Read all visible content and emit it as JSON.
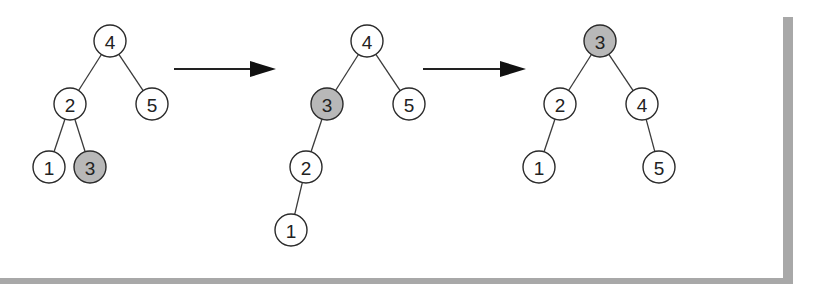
{
  "diagram": {
    "colors": {
      "node_fill": "#ffffff",
      "highlight_fill": "#b8b8b8",
      "stroke": "#2a2a2a",
      "frame": "#a8a8a8"
    },
    "node_radius": 16,
    "trees": [
      {
        "id": "tree-1",
        "nodes": [
          {
            "label": "4",
            "x": 110,
            "y": 41,
            "highlight": false
          },
          {
            "label": "2",
            "x": 70,
            "y": 104,
            "highlight": false
          },
          {
            "label": "5",
            "x": 152,
            "y": 104,
            "highlight": false
          },
          {
            "label": "1",
            "x": 49,
            "y": 167,
            "highlight": false
          },
          {
            "label": "3",
            "x": 90,
            "y": 167,
            "highlight": true
          }
        ],
        "edges": [
          [
            "4",
            "2"
          ],
          [
            "4",
            "5"
          ],
          [
            "2",
            "1"
          ],
          [
            "2",
            "3"
          ]
        ]
      },
      {
        "id": "tree-2",
        "nodes": [
          {
            "label": "4",
            "x": 367,
            "y": 41,
            "highlight": false
          },
          {
            "label": "3",
            "x": 327,
            "y": 104,
            "highlight": true
          },
          {
            "label": "5",
            "x": 409,
            "y": 104,
            "highlight": false
          },
          {
            "label": "2",
            "x": 306,
            "y": 167,
            "highlight": false
          },
          {
            "label": "1",
            "x": 291,
            "y": 230,
            "highlight": false
          }
        ],
        "edges": [
          [
            "4",
            "3"
          ],
          [
            "4",
            "5"
          ],
          [
            "3",
            "2"
          ],
          [
            "2",
            "1"
          ]
        ]
      },
      {
        "id": "tree-3",
        "nodes": [
          {
            "label": "3",
            "x": 600,
            "y": 41,
            "highlight": true
          },
          {
            "label": "2",
            "x": 560,
            "y": 104,
            "highlight": false
          },
          {
            "label": "4",
            "x": 642,
            "y": 104,
            "highlight": false
          },
          {
            "label": "1",
            "x": 539,
            "y": 167,
            "highlight": false
          },
          {
            "label": "5",
            "x": 659,
            "y": 167,
            "highlight": false
          }
        ],
        "edges": [
          [
            "3",
            "2"
          ],
          [
            "3",
            "4"
          ],
          [
            "2",
            "1"
          ],
          [
            "4",
            "5"
          ]
        ]
      }
    ],
    "arrows": [
      {
        "id": "arrow-1",
        "x1": 174,
        "x2": 276,
        "y": 69
      },
      {
        "id": "arrow-2",
        "x1": 423,
        "x2": 526,
        "y": 69
      }
    ]
  }
}
